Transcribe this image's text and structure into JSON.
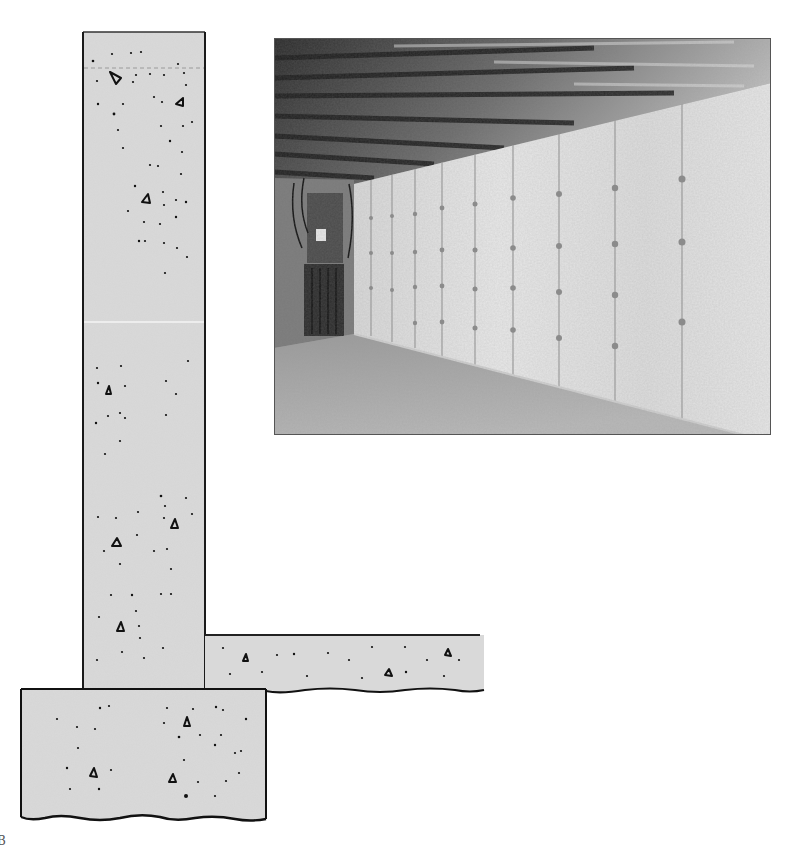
{
  "figure": {
    "illustration": {
      "subject": "concrete foundation cross-section",
      "parts": [
        {
          "id": "foundation-wall",
          "label": "Foundation wall"
        },
        {
          "id": "footing",
          "label": "Footing"
        },
        {
          "id": "floor-slab",
          "label": "Floor slab"
        }
      ],
      "colors": {
        "concrete_fill": "#d9d9d9",
        "outline": "#1a1a1a",
        "aggregate": "#111111"
      }
    },
    "photo": {
      "subject": "unfinished basement with poured concrete walls, exposed joists with insulation, electrical panel, concrete floor",
      "grayscale": true
    },
    "page_marker": "B"
  }
}
